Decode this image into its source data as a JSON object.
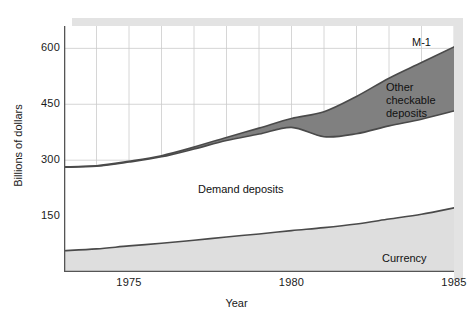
{
  "chart_data": {
    "type": "area",
    "title": "",
    "subtitle": "",
    "xlabel": "Year",
    "ylabel": "Billions of dollars",
    "stacked": true,
    "grid": true,
    "legend_position": "in-plot-annotations",
    "xlim": [
      1973,
      1985
    ],
    "ylim": [
      0,
      660
    ],
    "yticks": [
      150,
      300,
      450,
      600
    ],
    "ytick_labels": [
      "150",
      "300",
      "450",
      "600"
    ],
    "xticks": [
      1975,
      1980,
      1985
    ],
    "xtick_labels": [
      "1975",
      "1980",
      "1985"
    ],
    "x": [
      1973,
      1974,
      1975,
      1976,
      1977,
      1978,
      1979,
      1980,
      1981,
      1982,
      1983,
      1984,
      1985
    ],
    "series": [
      {
        "name": "Currency",
        "color": "#dedede",
        "values": [
          57,
          62,
          70,
          77,
          85,
          94,
          102,
          111,
          119,
          129,
          142,
          155,
          172
        ]
      },
      {
        "name": "Demand deposits",
        "color": "#ffffff",
        "values": [
          224,
          222,
          225,
          232,
          245,
          259,
          268,
          277,
          244,
          242,
          250,
          255,
          260
        ]
      },
      {
        "name": "Other checkable deposits",
        "color": "#808080",
        "values": [
          1,
          1,
          2,
          3,
          5,
          8,
          16,
          24,
          67,
          100,
          128,
          152,
          172
        ]
      }
    ],
    "totals_label": "M-1",
    "totals": [
      282,
      285,
      297,
      312,
      335,
      361,
      386,
      412,
      430,
      471,
      520,
      562,
      604
    ],
    "annotations": [
      {
        "text": "M-1",
        "x": 1984.6,
        "y": 640
      },
      {
        "text": "Other\ncheckable\ndeposits",
        "x": 1983.6,
        "y": 510
      },
      {
        "text": "Demand deposits",
        "x": 1977.5,
        "y": 225
      },
      {
        "text": "Currency",
        "x": 1984.0,
        "y": 48
      }
    ]
  },
  "axes": {
    "y_title": "Billions of dollars",
    "x_title": "Year",
    "y_ticks": [
      "600",
      "450",
      "300",
      "150"
    ],
    "x_ticks": [
      "1975",
      "1980",
      "1985"
    ]
  },
  "labels": {
    "m1": "M-1",
    "other_checkable": "Other\ncheckable\ndeposits",
    "demand_deposits": "Demand deposits",
    "currency": "Currency"
  },
  "colors": {
    "currency_fill": "#dedede",
    "demand_fill": "#ffffff",
    "other_fill": "#808080",
    "line": "#4a4a4a",
    "grid": "#cccccc",
    "axis": "#555555",
    "shadow": "#e3e3e3",
    "text": "#1a1a1a"
  }
}
